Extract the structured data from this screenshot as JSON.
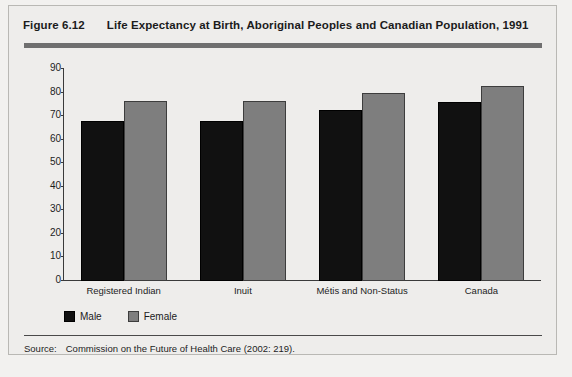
{
  "figure": {
    "number": "Figure 6.12",
    "title": "Life Expectancy at Birth, Aboriginal Peoples and Canadian Population, 1991",
    "source_label": "Source:",
    "source_text": "Commission on the Future of Health Care (2002: 219)."
  },
  "colors": {
    "male": "#111111",
    "female": "#7e7e7e",
    "axis": "#3a3a3a",
    "rule": "#6f6f6f",
    "background": "#eeedeb"
  },
  "chart_data": {
    "type": "bar",
    "title": "Life Expectancy at Birth, Aboriginal Peoples and Canadian Population, 1991",
    "xlabel": "",
    "ylabel": "",
    "ylim": [
      0,
      90
    ],
    "yticks": [
      0,
      10,
      20,
      30,
      40,
      50,
      60,
      70,
      80,
      90
    ],
    "ytick_labels": [
      "0",
      "10",
      "20",
      "30",
      "40",
      "50",
      "60",
      "70",
      "80",
      "90"
    ],
    "grid": false,
    "legend_position": "below-axes-left",
    "categories": [
      "Registered Indian",
      "Inuit",
      "Métis and Non-Status",
      "Canada"
    ],
    "series": [
      {
        "name": "Male",
        "color": "#111111",
        "values": [
          68,
          68,
          72.5,
          76
        ]
      },
      {
        "name": "Female",
        "color": "#7e7e7e",
        "values": [
          76.5,
          76.5,
          80,
          83
        ]
      }
    ]
  }
}
